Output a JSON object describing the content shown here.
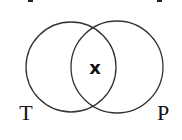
{
  "diagram": {
    "type": "venn",
    "sets": [
      {
        "name": "T",
        "label": "T",
        "cx": 71,
        "cy": 67,
        "r": 45
      },
      {
        "name": "P",
        "label": "P",
        "cx": 117,
        "cy": 67,
        "r": 46
      }
    ],
    "intersection_label": "x",
    "colors": {
      "stroke": "#333333",
      "text": "#111111",
      "background": "#ffffff"
    }
  }
}
